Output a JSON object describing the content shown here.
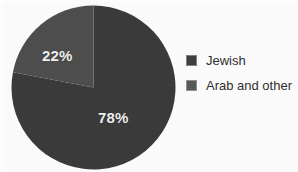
{
  "chart_data": {
    "type": "pie",
    "title": "",
    "subtitle": "",
    "xlabel": "",
    "ylabel": "",
    "categories": [
      "Jewish",
      "Arab and other"
    ],
    "values": [
      78,
      22
    ],
    "value_unit": "%",
    "data_labels": [
      "78%",
      "22%"
    ],
    "slices": [
      {
        "label": "Jewish",
        "value": 78,
        "data_label": "78%",
        "color": "#3a3a3a",
        "start_angle_deg": 0,
        "sweep_deg": 280.8,
        "direction": "clockwise"
      },
      {
        "label": "Arab and other",
        "value": 22,
        "data_label": "22%",
        "color": "#4d4d4d",
        "start_angle_deg": 0,
        "sweep_deg": 79.2,
        "direction": "counterclockwise"
      }
    ],
    "legend": {
      "position": "right",
      "entries": [
        {
          "label": "Jewish",
          "color": "#3f3f3f"
        },
        {
          "label": "Arab and other",
          "color": "#585858"
        }
      ]
    },
    "grid": false
  },
  "labels": {
    "minor": "22%",
    "major": "78%"
  },
  "legend": {
    "items": [
      {
        "label": "Jewish"
      },
      {
        "label": "Arab and other"
      }
    ]
  },
  "colors": {
    "slice_major": "#3a3a3a",
    "slice_minor": "#4d4d4d",
    "swatch_major": "#3f3f3f",
    "swatch_minor": "#585858",
    "label_text": "#f2f2f2",
    "legend_text": "#2f2f2f",
    "background": "#fdfdfd"
  }
}
